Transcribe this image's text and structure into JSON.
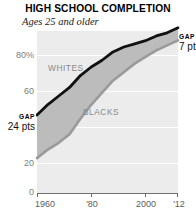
{
  "header": {
    "title": "HIGH SCHOOL COMPLETION",
    "subtitle": "Ages 25 and older"
  },
  "annotations": {
    "start_gap": {
      "word": "GAP",
      "value": "24 pts"
    },
    "end_gap": {
      "word": "GAP",
      "value": "7 pts"
    }
  },
  "colors": {
    "plot_background": "#ececec",
    "gridline": "#ffffff",
    "whites_line": "#111111",
    "blacks_line": "#9a9a9a",
    "band_fill": "#bcbcbc",
    "axis": "#6f6f6f",
    "tick_text": "#7d7d7d",
    "series_label": "#8a8a8a"
  },
  "chart_data": {
    "type": "area",
    "title": "HIGH SCHOOL COMPLETION",
    "subtitle": "Ages 25 and older",
    "xlabel": "",
    "ylabel": "",
    "xlim": [
      1960,
      2012
    ],
    "ylim": [
      0,
      90
    ],
    "grid": true,
    "legend": "inline-labels",
    "y_ticks": [
      {
        "value": 80,
        "label": "80%"
      },
      {
        "value": 60,
        "label": "60"
      },
      {
        "value": 40,
        "label": "40"
      },
      {
        "value": 20,
        "label": "20"
      },
      {
        "value": 0,
        "label": "0"
      }
    ],
    "x_ticks": [
      {
        "value": 1960,
        "label": "1960"
      },
      {
        "value": 1980,
        "label": "'80"
      },
      {
        "value": 2000,
        "label": "2000"
      },
      {
        "value": 2012,
        "label": "'12"
      }
    ],
    "x": [
      1960,
      1964,
      1968,
      1972,
      1976,
      1980,
      1984,
      1988,
      1992,
      1996,
      2000,
      2004,
      2008,
      2012
    ],
    "series": [
      {
        "name": "WHITES",
        "label": "WHITES",
        "color": "#111111",
        "values": [
          43,
          49,
          54,
          59,
          65,
          70,
          74,
          78,
          81,
          83,
          85,
          87,
          89,
          92
        ]
      },
      {
        "name": "BLACKS",
        "label": "BLACKS",
        "color": "#9a9a9a",
        "values": [
          19,
          24,
          28,
          33,
          41,
          49,
          56,
          62,
          67,
          72,
          76,
          79,
          82,
          85
        ]
      }
    ],
    "gap_start_pts": 24,
    "gap_end_pts": 7
  }
}
